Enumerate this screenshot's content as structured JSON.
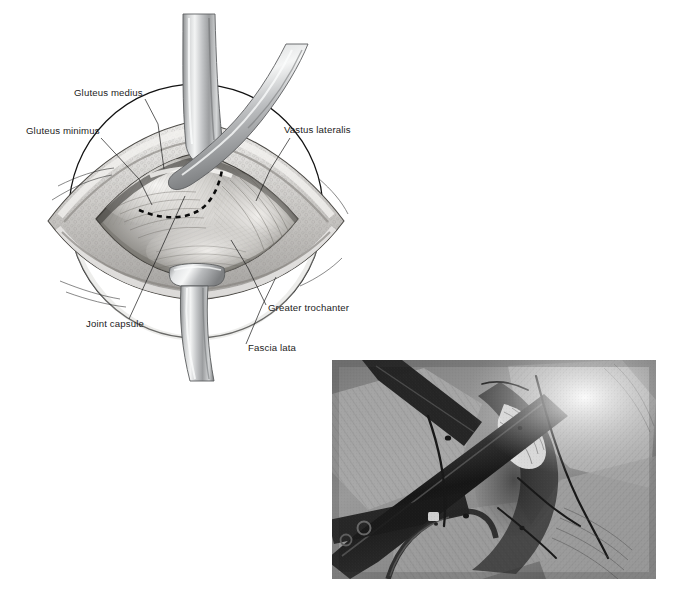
{
  "figure": {
    "kind": "surgical-anatomy-illustration-with-photo",
    "width": 682,
    "height": 595,
    "background_color": "#ffffff",
    "rendering": "grayscale"
  },
  "illustration": {
    "title": "",
    "description": "Grayscale line-and-tone drawing of a lateral hip surgical exposure. A diamond/lens shaped wound is held open, with three metal retractor blades and a dashed planned capsular incision line.",
    "dashed_line_meaning": "planned capsulotomy incision",
    "retractors": [
      {
        "name": "superior-retractor",
        "orientation": "vertical-top"
      },
      {
        "name": "oblique-retractor",
        "orientation": "from-upper-right"
      },
      {
        "name": "inferior-retractor",
        "orientation": "vertical-bottom"
      }
    ],
    "labels": [
      {
        "id": "gluteus-medius",
        "text": "Gluteus medius",
        "text_x": 74,
        "text_y": 96,
        "anchor": "start",
        "leader": "M 145 99 L 158 124 L 164 169"
      },
      {
        "id": "gluteus-minimus",
        "text": "Gluteus minimus",
        "text_x": 26,
        "text_y": 134,
        "anchor": "start",
        "leader": "M 101 138 L 139 179 L 152 205"
      },
      {
        "id": "vastus-lateralis",
        "text": "Vastus lateralis",
        "text_x": 284,
        "text_y": 133,
        "anchor": "start",
        "leader": "M 290 138 L 270 170 L 256 201"
      },
      {
        "id": "joint-capsule",
        "text": "Joint capsule",
        "text_x": 86,
        "text_y": 327,
        "anchor": "start",
        "leader": "M 129 319 L 157 258 L 185 196"
      },
      {
        "id": "greater-trochanter",
        "text": "Greater trochanter",
        "text_x": 268,
        "text_y": 311,
        "anchor": "start",
        "leader": "M 266 305 L 248 268 L 231 240"
      },
      {
        "id": "fascia-lata",
        "text": "Fascia lata",
        "text_x": 248,
        "text_y": 351,
        "anchor": "start",
        "leader": "M 246 344 L 262 306 L 276 277"
      }
    ]
  },
  "photograph": {
    "caption": "",
    "description": "Grayscale intraoperative photograph of the same lateral hip exposure: dark retractor blades cross the field, pale muscle and fascia are spread open, and dark suture strands run across the wound.",
    "x": 332,
    "y": 360,
    "width": 324,
    "height": 219,
    "tone": "black-and-white"
  }
}
